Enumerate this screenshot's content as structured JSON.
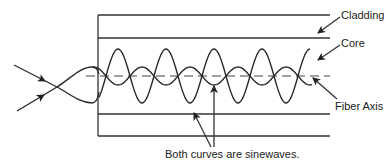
{
  "diagram": {
    "type": "optical-fiber-mode-diagram",
    "labels": {
      "cladding": "Cladding",
      "core": "Core",
      "fiber_axis": "Fiber Axis",
      "caption": "Both curves are sinewaves."
    },
    "colors": {
      "line": "#333333",
      "background": "#ffffff"
    },
    "geometry": {
      "fiber_left_x": 98,
      "fiber_right_x": 330,
      "cladding_top_y": 15,
      "core_top_y": 38,
      "axis_y": 76,
      "core_bottom_y": 114,
      "cladding_bottom_y": 136
    },
    "waves": [
      {
        "name": "large-sinewave",
        "amplitude": 27,
        "period": 48,
        "phase_x": 106
      },
      {
        "name": "small-sinewave",
        "amplitude": 9,
        "period": 48,
        "phase_x": 106
      }
    ]
  }
}
